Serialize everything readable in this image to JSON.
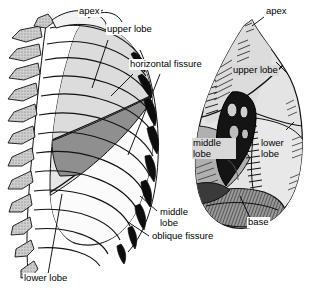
{
  "figure": {
    "background_color": "#ffffff",
    "ink_color": "#000000",
    "width": 318,
    "height": 298
  },
  "palette": {
    "lung_light": "#e3e3e3",
    "lung_mid": "#b9b9b9",
    "lung_dark": "#8a8a8a",
    "hilum_dark": "#1a1a1a",
    "bone_stipple": "#c9c9c9",
    "outline": "#000000",
    "label_box": "#ffffff",
    "label_box_shaded": "#d8d8d8"
  },
  "panels": [
    {
      "id": "left-panel",
      "name": "thorax-rib-cage-lateral-view",
      "description": "Lateral view of rib cage with vertebral column and lung lobes"
    },
    {
      "id": "right-panel",
      "name": "lung-medial-surface-view",
      "description": "Medial surface of lung showing hilum, fissures and lobes"
    }
  ],
  "labels": {
    "left": [
      {
        "id": "apex",
        "text": "apex",
        "x": 78,
        "y": 11,
        "style": "plain"
      },
      {
        "id": "upper_lobe",
        "text": "upper lobe",
        "x": 106,
        "y": 28,
        "style": "plain"
      },
      {
        "id": "horizontal_fissure",
        "text": "horizontal fissure",
        "x": 129,
        "y": 63,
        "style": "plain"
      },
      {
        "id": "middle_lobe",
        "text": "middle lobe",
        "x": 159,
        "y": 211,
        "style": "two-line"
      },
      {
        "id": "oblique_fissure",
        "text": "oblique fissure",
        "x": 151,
        "y": 235,
        "style": "plain"
      },
      {
        "id": "lower_lobe",
        "text": "lower lobe",
        "x": 23,
        "y": 277,
        "style": "plain"
      }
    ],
    "right": [
      {
        "id": "apex_r",
        "text": "apex",
        "x": 265,
        "y": 11,
        "style": "plain"
      },
      {
        "id": "upper_lobe_r",
        "text": "upper lobe",
        "x": 232,
        "y": 69,
        "style": "shaded-box"
      },
      {
        "id": "middle_lobe_r",
        "text": "middle lobe",
        "x": 192,
        "y": 142,
        "style": "shaded-box-two-line"
      },
      {
        "id": "lower_lobe_r",
        "text": "lower lobe",
        "x": 261,
        "y": 142,
        "style": "two-line"
      },
      {
        "id": "base_r",
        "text": "base",
        "x": 247,
        "y": 221,
        "style": "plain"
      }
    ]
  },
  "leader_lines": {
    "count": 11,
    "color": "#000000",
    "width": 0.8
  },
  "anatomy_terms": [
    "apex",
    "upper lobe",
    "middle lobe",
    "lower lobe",
    "horizontal fissure",
    "oblique fissure",
    "base"
  ]
}
